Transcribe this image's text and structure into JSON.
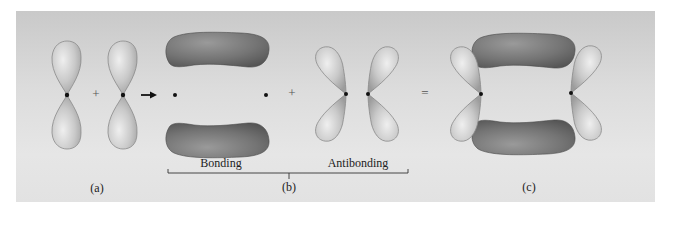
{
  "figure": {
    "panels": [
      {
        "id": "a",
        "label": "(a)",
        "content": "two p orbitals (p + p)"
      },
      {
        "id": "b",
        "label": "(b)",
        "content": "bonding + antibonding orbitals"
      },
      {
        "id": "c",
        "label": "(c)",
        "content": "combined bonding and antibonding orbitals"
      }
    ],
    "labels": {
      "a": "(a)",
      "b": "(b)",
      "c": "(c)",
      "bonding": "Bonding",
      "antibonding": "Antibonding"
    },
    "operators": {
      "plus_1": "+",
      "arrow": "→",
      "plus_2": "+",
      "equals": "="
    },
    "colors": {
      "background": "#ffffff",
      "panel": "#dcdcdc",
      "p_lobe": "#c8c8c8",
      "bonding_lobe": "#7a7a7a",
      "nucleus": "#111111",
      "text": "#222222"
    }
  }
}
